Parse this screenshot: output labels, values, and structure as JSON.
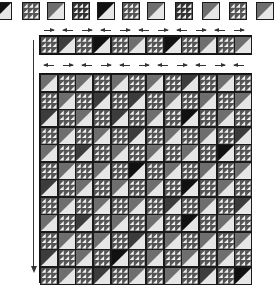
{
  "diagram": {
    "title": "",
    "kind": "quilt-layout-diagram",
    "block_types": {
      "H": "half-square-triangle",
      "N": "nine-patch-triangles"
    },
    "colors": {
      "outline": "#1a1a1a",
      "light": "#e6e6e6",
      "mid": "#6e6e6e",
      "dark": "#3c3c3c",
      "black": "#111111",
      "arrow": "#333333"
    },
    "top_row": {
      "blocks": [
        "H:black",
        "N",
        "H:mid",
        "N:dark",
        "H:black",
        "N",
        "H:mid",
        "N:dark",
        "H:mid",
        "N",
        "H:mid"
      ]
    },
    "strip_row": {
      "blocks": [
        "N",
        "H:dark",
        "N",
        "H:black",
        "N",
        "H:mid",
        "N",
        "H:black",
        "N",
        "H:mid",
        "N",
        "H:mid"
      ],
      "press_arrows_above": [
        "r",
        "l",
        "r",
        "l",
        "r",
        "l",
        "r",
        "l",
        "r",
        "l",
        "r"
      ],
      "press_arrows_below": [
        "l",
        "r",
        "l",
        "r",
        "l",
        "r",
        "l",
        "r",
        "l",
        "r",
        "l"
      ]
    },
    "main_grid": {
      "cols": 12,
      "rows": 12,
      "hst_shades": [
        [
          "mid",
          "mid",
          "mid",
          "mid",
          "dark",
          "mid"
        ],
        [
          "mid",
          "dark",
          "dark",
          "mid",
          "mid",
          "mid"
        ],
        [
          "dark",
          "mid",
          "dark",
          "mid",
          "black",
          "mid"
        ],
        [
          "mid",
          "mid",
          "dark",
          "mid",
          "mid",
          "dark"
        ],
        [
          "mid",
          "dark",
          "mid",
          "mid",
          "mid",
          "black"
        ],
        [
          "mid",
          "mid",
          "black",
          "mid",
          "mid",
          "mid"
        ],
        [
          "dark",
          "mid",
          "mid",
          "mid",
          "black",
          "mid"
        ],
        [
          "mid",
          "mid",
          "mid",
          "dark",
          "mid",
          "dark"
        ],
        [
          "mid",
          "dark",
          "mid",
          "mid",
          "black",
          "mid"
        ],
        [
          "mid",
          "mid",
          "dark",
          "mid",
          "mid",
          "mid"
        ],
        [
          "dark",
          "mid",
          "black",
          "mid",
          "mid",
          "mid"
        ],
        [
          "mid",
          "dark",
          "mid",
          "mid",
          "dark",
          "black"
        ]
      ]
    },
    "left_arrow": {
      "direction": "down"
    }
  }
}
